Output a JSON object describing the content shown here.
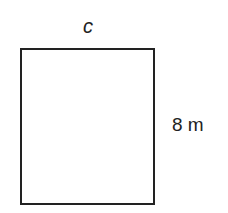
{
  "diagram": {
    "shape": "rectangle",
    "stroke_color": "#222222",
    "fill_color": "#ffffff",
    "labels": {
      "top": "c",
      "right": "8 m"
    }
  }
}
